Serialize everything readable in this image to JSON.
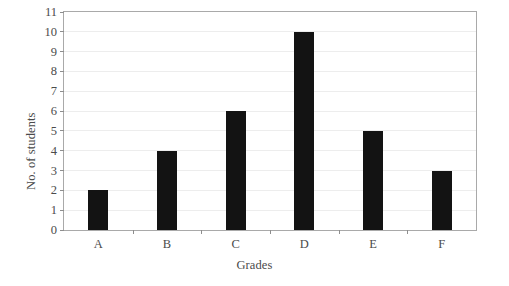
{
  "chart_data": {
    "type": "bar",
    "title": "",
    "categories": [
      "A",
      "B",
      "C",
      "D",
      "E",
      "F"
    ],
    "values": [
      2,
      4,
      6,
      10,
      5,
      3
    ],
    "xlabel": "Grades",
    "ylabel": "No. of students",
    "ylim": [
      0,
      11
    ],
    "ytick_labels": [
      "0",
      "1",
      "2",
      "3",
      "4",
      "5",
      "6",
      "7",
      "8",
      "9",
      "10",
      "11"
    ],
    "ytick_values": [
      0,
      1,
      2,
      3,
      4,
      5,
      6,
      7,
      8,
      9,
      10,
      11
    ],
    "grid": true,
    "grid_axis": "y",
    "legend": false,
    "bar_color": "#131313",
    "background_color": "#ffffff",
    "axis_color": "#a9a9a9",
    "grid_color": "#ededed",
    "xtick_position": "between-categories"
  }
}
